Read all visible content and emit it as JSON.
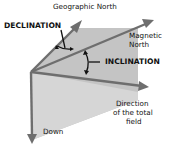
{
  "diagram": {
    "labels": {
      "geographic_north": "Geographic North",
      "declination": "DECLINATION",
      "magnetic_north_1": "Magnetic",
      "magnetic_north_2": "North",
      "inclination": "INCLINATION",
      "direction_1": "Direction",
      "direction_2": "of the total",
      "direction_3": "field",
      "down": "Down"
    },
    "colors": {
      "arrow": "#6e6e6e",
      "plane_light": "#dcdcdc",
      "plane_dark": "#bdbdbd",
      "angle_marks": "#111111"
    }
  }
}
